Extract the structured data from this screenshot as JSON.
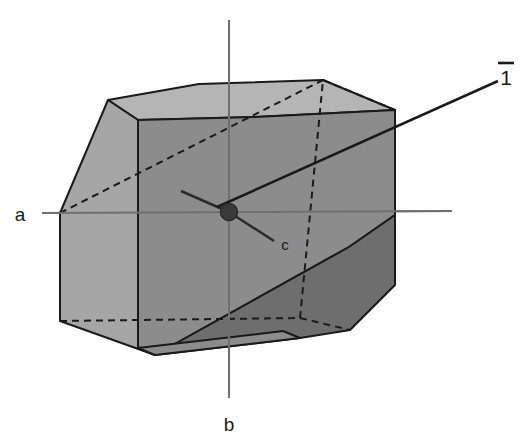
{
  "figure": {
    "background_color": "#ffffff",
    "width": 529,
    "height": 441
  },
  "labels": {
    "axis_a": "a",
    "axis_b": "b",
    "axis_c": "c",
    "symmetry_element": "1",
    "symmetry_overbar": "̄"
  },
  "colors": {
    "face_top": "#b5b5b5",
    "face_left": "#a6a6a6",
    "face_front": "#8c8c8c",
    "face_lower_right": "#6e6e6e",
    "edge": "#1a1a1a",
    "hidden_edge": "#1a1a1a",
    "axis_line": "#7a7a7a",
    "leader_line": "#1a1a1a",
    "centre_dot": "#3a3a3a",
    "text": "#1a1a1a"
  },
  "geometry": {
    "centre_point": {
      "x": 229,
      "y": 212
    },
    "centre_dot_radius": 8,
    "axis_a": {
      "x1": 42,
      "y1": 213,
      "x2": 452,
      "y2": 211
    },
    "axis_b": {
      "x1": 229,
      "y1": 20,
      "x2": 229,
      "y2": 398
    },
    "axis_c": {
      "x1": 229,
      "y1": 212,
      "x2": 272,
      "y2": 240
    },
    "axis_c_back": {
      "x1": 229,
      "y1": 212,
      "x2": 183,
      "y2": 192
    },
    "leader_inversion": {
      "x1": 216,
      "y1": 207,
      "x2": 500,
      "y2": 82
    },
    "faces": {
      "top": "108,100 199,84 323,80 395,110 255,117 138,120",
      "left": "108,100 138,120 138,348 60,321 60,213",
      "front": "138,120 255,117 395,110 395,215 349,247 155,355 138,348",
      "lower_right": "395,215 395,285 350,330 155,355 349,247",
      "bottom_sliver": "138,348 155,355 350,330 300,338"
    },
    "hidden_edges": [
      "60,213 323,80",
      "60,321 138,348",
      "60,321 300,318",
      "300,318 300,338",
      "300,318 323,80",
      "300,338 350,330",
      "323,80 395,110"
    ]
  },
  "annotations": {
    "label_a_position": {
      "x": 12,
      "y": 220
    },
    "label_b_position": {
      "x": 221,
      "y": 430
    },
    "label_c_position": {
      "x": 277,
      "y": 248
    },
    "label_inversion_position": {
      "x": 497,
      "y": 90
    },
    "overbar_position": {
      "x": 497,
      "y": 68,
      "width": 16
    }
  }
}
